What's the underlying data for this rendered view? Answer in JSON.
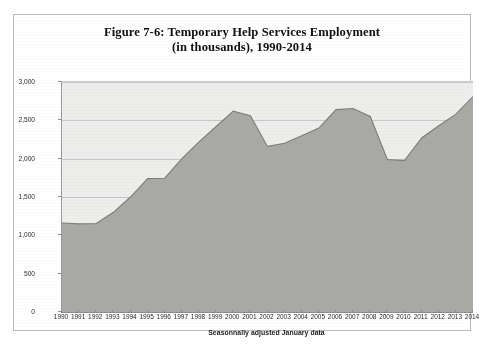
{
  "figure": {
    "title_line1": "Figure 7-6: Temporary Help Services Employment",
    "title_line2": "(in thousands), 1990-2014",
    "caption": "Seasonnally adjusted January data"
  },
  "colors": {
    "area_fill": "#a9aaa6",
    "area_stroke": "#7d7e7a",
    "plot_background": "#edeeec",
    "gridline": "#c3c7cc",
    "axis": "#8c8c8c",
    "frame_border": "#b9b9b9",
    "text": "#2a2a2a"
  },
  "chart_data": {
    "type": "area",
    "title": "Figure 7-6: Temporary Help Services Employment (in thousands), 1990-2014",
    "xlabel": "Seasonnally adjusted January data",
    "ylabel": "",
    "ylim": [
      0,
      3000
    ],
    "y_ticks": [
      0,
      500,
      1000,
      1500,
      2000,
      2500,
      3000
    ],
    "y_tick_labels": [
      "0",
      "500",
      "1,000",
      "1,500",
      "2,000",
      "2,500",
      "3,000"
    ],
    "grid": true,
    "legend": "none",
    "categories": [
      "1990",
      "1991",
      "1992",
      "1993",
      "1994",
      "1995",
      "1996",
      "1997",
      "1998",
      "1999",
      "2000",
      "2001",
      "2002",
      "2003",
      "2004",
      "2005",
      "2006",
      "2007",
      "2008",
      "2009",
      "2010",
      "2011",
      "2012",
      "2013",
      "2014"
    ],
    "values": [
      1160,
      1150,
      1155,
      1300,
      1500,
      1740,
      1745,
      2000,
      2220,
      2420,
      2620,
      2560,
      2160,
      2200,
      2300,
      2400,
      2640,
      2655,
      2550,
      1990,
      1975,
      2270,
      2430,
      2580,
      2810
    ],
    "units": "thousands of jobs"
  }
}
